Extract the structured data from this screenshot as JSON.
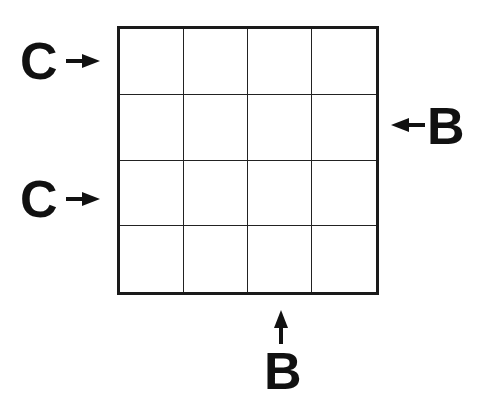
{
  "puzzle": {
    "rows": 4,
    "cols": 4,
    "clues": [
      {
        "side": "left",
        "row": 1,
        "letter": "C",
        "arrow": "right"
      },
      {
        "side": "left",
        "row": 3,
        "letter": "C",
        "arrow": "right"
      },
      {
        "side": "right",
        "row": 2,
        "letter": "B",
        "arrow": "left"
      },
      {
        "side": "bottom",
        "col": 3,
        "letter": "B",
        "arrow": "up"
      }
    ]
  },
  "colors": {
    "line": "#1a1a1a",
    "background": "#ffffff"
  }
}
